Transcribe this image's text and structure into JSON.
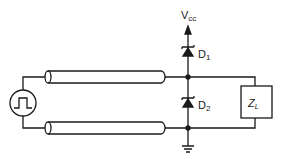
{
  "diagram": {
    "type": "circuit-schematic",
    "labels": {
      "supply_main": "V",
      "supply_sub": "cc",
      "diode1_main": "D",
      "diode1_sub": "1",
      "diode2_main": "D",
      "diode2_sub": "2",
      "load_main": "Z",
      "load_sub": "L"
    },
    "components": [
      {
        "id": "pulse-source",
        "kind": "square-pulse generator"
      },
      {
        "id": "coax-top",
        "kind": "transmission line (coaxial)"
      },
      {
        "id": "coax-bottom",
        "kind": "transmission line (coaxial)"
      },
      {
        "id": "D1",
        "kind": "Schottky diode to Vcc"
      },
      {
        "id": "D2",
        "kind": "Schottky diode to ground"
      },
      {
        "id": "ZL",
        "kind": "load impedance"
      },
      {
        "id": "ground",
        "kind": "ground symbol"
      }
    ],
    "colors": {
      "line": "#1a1a1a",
      "cable_fill": "#ffffff",
      "background": "#ffffff"
    }
  }
}
